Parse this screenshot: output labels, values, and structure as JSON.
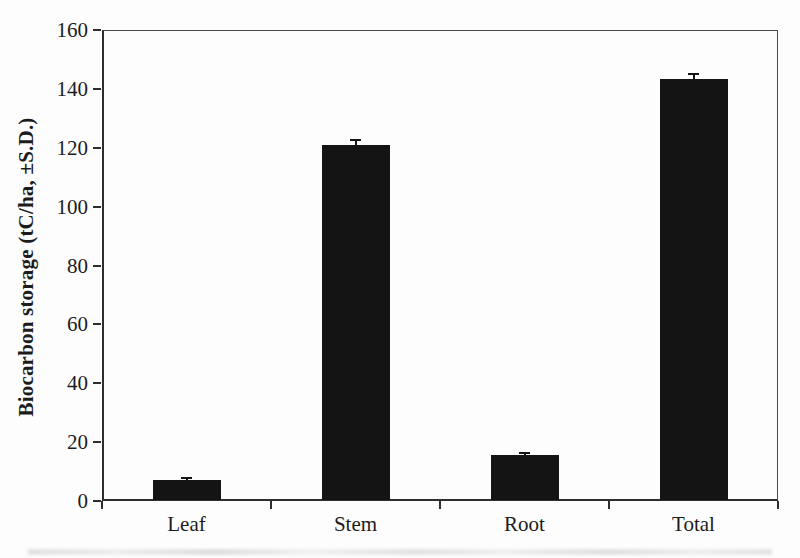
{
  "figure": {
    "background_color": "#fdfdfd",
    "bar_color": "#141414",
    "axis_color": "#2e2e2e",
    "text_color": "#1c1c1c"
  },
  "chart_data": {
    "type": "bar",
    "title": "",
    "xlabel": "",
    "ylabel": "Biocarbon storage (tC/ha, ±S.D.)",
    "categories": [
      "Leaf",
      "Stem",
      "Root",
      "Total"
    ],
    "values": [
      7,
      121,
      15.5,
      143.5
    ],
    "errors": [
      0.5,
      1.5,
      0.8,
      1.5
    ],
    "ylim": [
      0,
      160
    ],
    "ytick_step": 20,
    "ytick_labels": [
      "0",
      "20",
      "40",
      "60",
      "80",
      "100",
      "120",
      "140",
      "160"
    ],
    "grid": false,
    "legend_position": "none",
    "error_bars": true
  }
}
